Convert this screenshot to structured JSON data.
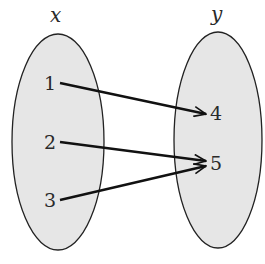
{
  "diagram": {
    "type": "mapping",
    "domain_set": {
      "label": "x",
      "elements": [
        "1",
        "2",
        "3"
      ],
      "fill": "#e6e6e6",
      "stroke": "#222222"
    },
    "codomain_set": {
      "label": "y",
      "elements": [
        "4",
        "5"
      ],
      "fill": "#e6e6e6",
      "stroke": "#222222"
    },
    "mappings": [
      {
        "from": "1",
        "to": "4"
      },
      {
        "from": "2",
        "to": "5"
      },
      {
        "from": "3",
        "to": "5"
      }
    ],
    "arrow_color": "#111111"
  }
}
